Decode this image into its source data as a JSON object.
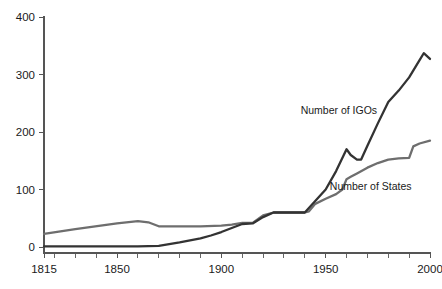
{
  "chart_data": {
    "type": "line",
    "title": "",
    "xlabel": "",
    "ylabel": "",
    "xlim": [
      1815,
      2000
    ],
    "ylim": [
      0,
      400
    ],
    "grid": false,
    "legend_position": "inline-annotation",
    "x_ticks_major": [
      1815,
      1850,
      1900,
      1950,
      2000
    ],
    "x_tick_labels": [
      "1815",
      "1850",
      "1900",
      "1950",
      "2000"
    ],
    "x_ticks_minor_step": 10,
    "y_ticks": [
      0,
      100,
      200,
      300,
      400
    ],
    "y_tick_labels": [
      "0",
      "100",
      "200",
      "300",
      "400"
    ],
    "series": [
      {
        "name": "Number of IGOs",
        "color": "#333333",
        "label_x": 1938,
        "label_y": 232,
        "x": [
          1815,
          1850,
          1860,
          1870,
          1880,
          1890,
          1895,
          1900,
          1905,
          1910,
          1915,
          1920,
          1925,
          1930,
          1935,
          1940,
          1945,
          1950,
          1955,
          1960,
          1962,
          1965,
          1967,
          1970,
          1975,
          1980,
          1985,
          1990,
          1995,
          1997,
          2000
        ],
        "values": [
          1,
          1,
          1,
          2,
          8,
          15,
          20,
          26,
          33,
          40,
          41,
          52,
          60,
          60,
          60,
          60,
          80,
          100,
          132,
          170,
          160,
          152,
          152,
          176,
          215,
          252,
          272,
          295,
          325,
          337,
          327
        ]
      },
      {
        "name": "Number of States",
        "color": "#6e6e6e",
        "label_x": 1952,
        "label_y": 100,
        "x": [
          1815,
          1830,
          1850,
          1860,
          1865,
          1870,
          1880,
          1890,
          1900,
          1905,
          1910,
          1915,
          1920,
          1925,
          1930,
          1935,
          1940,
          1942,
          1945,
          1950,
          1955,
          1958,
          1960,
          1962,
          1965,
          1970,
          1975,
          1980,
          1985,
          1990,
          1992,
          1995,
          2000
        ],
        "values": [
          23,
          31,
          41,
          45,
          43,
          36,
          36,
          36,
          37,
          39,
          42,
          42,
          55,
          60,
          60,
          60,
          60,
          62,
          75,
          84,
          92,
          100,
          118,
          122,
          128,
          138,
          146,
          152,
          154,
          155,
          175,
          180,
          185
        ]
      }
    ],
    "annotations": [
      {
        "text": "Number of IGOs",
        "x": 1938,
        "y": 232
      },
      {
        "text": "Number of States",
        "x": 1952,
        "y": 100
      }
    ]
  },
  "axes": {
    "y_axis_name": "value-axis",
    "x_axis_name": "year-axis"
  }
}
